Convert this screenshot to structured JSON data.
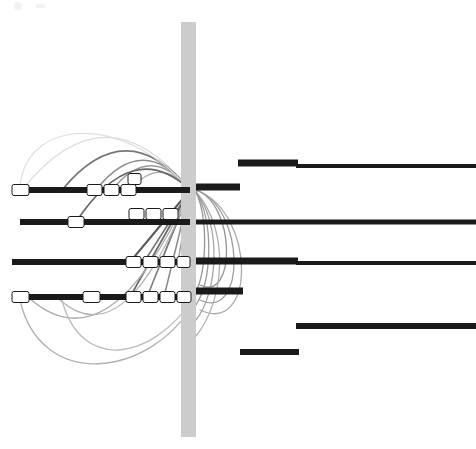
{
  "figure": {
    "title": "",
    "background_color": "#ffffff",
    "width": 476,
    "height": 449
  },
  "chart_data": {
    "type": "diagram",
    "subtype": "synteny-arc-linkage-plot",
    "title": "",
    "subtitle": "",
    "xlabel": "",
    "ylabel": "",
    "grid": false,
    "legend": null,
    "xlim": [
      0,
      476
    ],
    "ylim": [
      0,
      449
    ],
    "colors": {
      "track_dark": "#1a1a1a",
      "track_medium": "#2b2b2b",
      "feature_fill": "#ffffff",
      "feature_stroke": "#1a1a1a",
      "band_fill": "#cccccc",
      "arc_dark": "#555555",
      "arc_mid": "#8c8c8c",
      "arc_light": "#bdbdbd",
      "arc_faint": "#dcdcdc",
      "background": "#ffffff"
    },
    "hub": {
      "x": 190,
      "y": 190,
      "label": "convergence-hub"
    },
    "vertical_band": {
      "x": 181,
      "y": 22,
      "width": 15,
      "height": 415,
      "color": "#cccccc",
      "label": "highlight-band"
    },
    "left_tracks": [
      {
        "id": "left-track-1",
        "y": 190,
        "x_start": 12,
        "x_end": 190,
        "thickness": 6,
        "color": "#1a1a1a",
        "features": [
          {
            "x": 12,
            "width": 17,
            "height": 11
          },
          {
            "x": 87,
            "width": 15,
            "height": 11
          },
          {
            "x": 104,
            "width": 15,
            "height": 11
          },
          {
            "x": 121,
            "width": 15,
            "height": 11
          },
          {
            "x": 128,
            "width": 13,
            "height": 11,
            "offset_y": -11
          }
        ]
      },
      {
        "id": "left-track-2",
        "y": 222,
        "x_start": 20,
        "x_end": 190,
        "thickness": 6,
        "color": "#1a1a1a",
        "features": [
          {
            "x": 68,
            "width": 16,
            "height": 11
          },
          {
            "x": 129,
            "width": 15,
            "height": 11,
            "offset_y": -8
          },
          {
            "x": 146,
            "width": 15,
            "height": 11,
            "offset_y": -8
          },
          {
            "x": 163,
            "width": 15,
            "height": 11,
            "offset_y": -8
          }
        ]
      },
      {
        "id": "left-track-3",
        "y": 262,
        "x_start": 12,
        "x_end": 190,
        "thickness": 6,
        "color": "#1a1a1a",
        "features": [
          {
            "x": 126,
            "width": 15,
            "height": 11
          },
          {
            "x": 143,
            "width": 15,
            "height": 11
          },
          {
            "x": 160,
            "width": 15,
            "height": 11
          },
          {
            "x": 177,
            "width": 13,
            "height": 11
          }
        ]
      },
      {
        "id": "left-track-4",
        "y": 297,
        "x_start": 12,
        "x_end": 190,
        "thickness": 6,
        "color": "#1a1a1a",
        "features": [
          {
            "x": 12,
            "width": 17,
            "height": 11
          },
          {
            "x": 83,
            "width": 17,
            "height": 11
          },
          {
            "x": 126,
            "width": 15,
            "height": 11
          },
          {
            "x": 143,
            "width": 15,
            "height": 11
          },
          {
            "x": 160,
            "width": 15,
            "height": 11
          },
          {
            "x": 177,
            "width": 14,
            "height": 11
          }
        ]
      }
    ],
    "right_tracks": [
      {
        "id": "right-track-1a",
        "y": 163,
        "x_start": 238,
        "x_end": 298,
        "thickness": 7,
        "color": "#1a1a1a"
      },
      {
        "id": "right-track-1b",
        "y": 166,
        "x_start": 296,
        "x_end": 476,
        "thickness": 4,
        "color": "#1a1a1a"
      },
      {
        "id": "right-track-2",
        "y": 187,
        "x_start": 196,
        "x_end": 240,
        "thickness": 7,
        "color": "#1a1a1a"
      },
      {
        "id": "right-track-3",
        "y": 222,
        "x_start": 196,
        "x_end": 476,
        "thickness": 5,
        "color": "#1a1a1a"
      },
      {
        "id": "right-track-4a",
        "y": 261,
        "x_start": 196,
        "x_end": 298,
        "thickness": 7,
        "color": "#1a1a1a"
      },
      {
        "id": "right-track-4b",
        "y": 263,
        "x_start": 296,
        "x_end": 476,
        "thickness": 4,
        "color": "#1a1a1a"
      },
      {
        "id": "right-track-5",
        "y": 291,
        "x_start": 196,
        "x_end": 243,
        "thickness": 7,
        "color": "#1a1a1a"
      },
      {
        "id": "right-track-6",
        "y": 326,
        "x_start": 296,
        "x_end": 476,
        "thickness": 6,
        "color": "#1a1a1a"
      },
      {
        "id": "right-track-7",
        "y": 352,
        "x_start": 240,
        "x_end": 299,
        "thickness": 6,
        "color": "#1a1a1a"
      }
    ],
    "arcs": [
      {
        "id": "arc-1",
        "from_x": 22,
        "from_y": 190,
        "to_x": 190,
        "to_y": 190,
        "rise": 78,
        "color": "#dcdcdc",
        "width": 1.2,
        "direction": "up"
      },
      {
        "id": "arc-2",
        "from_x": 62,
        "from_y": 190,
        "to_x": 190,
        "to_y": 190,
        "rise": 58,
        "color": "#777777",
        "width": 1.8,
        "direction": "up"
      },
      {
        "id": "arc-3",
        "from_x": 96,
        "from_y": 190,
        "to_x": 190,
        "to_y": 190,
        "rise": 44,
        "color": "#8c8c8c",
        "width": 1.6,
        "direction": "up"
      },
      {
        "id": "arc-4",
        "from_x": 112,
        "from_y": 190,
        "to_x": 190,
        "to_y": 190,
        "rise": 36,
        "color": "#9a9a9a",
        "width": 1.4,
        "direction": "up"
      },
      {
        "id": "arc-5",
        "from_x": 130,
        "from_y": 190,
        "to_x": 190,
        "to_y": 190,
        "rise": 26,
        "color": "#a8a8a8",
        "width": 1.3,
        "direction": "up"
      },
      {
        "id": "arc-6",
        "from_x": 76,
        "from_y": 222,
        "to_x": 190,
        "to_y": 190,
        "rise": 40,
        "color": "#666666",
        "width": 1.8,
        "direction": "up"
      },
      {
        "id": "arc-7",
        "from_x": 130,
        "from_y": 262,
        "to_x": 190,
        "to_y": 190,
        "rise": 0,
        "color": "#5a5a5a",
        "width": 2.0,
        "direction": "straight"
      },
      {
        "id": "arc-8",
        "from_x": 144,
        "from_y": 262,
        "to_x": 190,
        "to_y": 190,
        "rise": 0,
        "color": "#777777",
        "width": 1.6,
        "direction": "straight"
      },
      {
        "id": "arc-9",
        "from_x": 161,
        "from_y": 262,
        "to_x": 190,
        "to_y": 190,
        "rise": 0,
        "color": "#888888",
        "width": 1.5,
        "direction": "straight"
      },
      {
        "id": "arc-10",
        "from_x": 178,
        "from_y": 262,
        "to_x": 190,
        "to_y": 190,
        "rise": 0,
        "color": "#999999",
        "width": 1.4,
        "direction": "straight"
      },
      {
        "id": "arc-11",
        "from_x": 130,
        "from_y": 297,
        "to_x": 190,
        "to_y": 190,
        "rise": 0,
        "color": "#6a6a6a",
        "width": 1.7,
        "direction": "straight"
      },
      {
        "id": "arc-12",
        "from_x": 147,
        "from_y": 297,
        "to_x": 190,
        "to_y": 190,
        "rise": 0,
        "color": "#7a7a7a",
        "width": 1.6,
        "direction": "straight"
      },
      {
        "id": "arc-13",
        "from_x": 164,
        "from_y": 297,
        "to_x": 190,
        "to_y": 190,
        "rise": 0,
        "color": "#8a8a8a",
        "width": 1.5,
        "direction": "straight"
      },
      {
        "id": "arc-14",
        "from_x": 181,
        "from_y": 297,
        "to_x": 190,
        "to_y": 190,
        "rise": 0,
        "color": "#9a9a9a",
        "width": 1.4,
        "direction": "straight"
      },
      {
        "id": "arc-15",
        "from_x": 190,
        "from_y": 190,
        "to_x": 28,
        "to_y": 297,
        "rise": 70,
        "color": "#aaaaaa",
        "width": 1.3,
        "direction": "down"
      },
      {
        "id": "arc-16",
        "from_x": 190,
        "from_y": 190,
        "to_x": 60,
        "to_y": 300,
        "rise": 55,
        "color": "#b5b5b5",
        "width": 1.3,
        "direction": "down"
      },
      {
        "id": "arc-17",
        "from_x": 196,
        "from_y": 190,
        "to_x": 200,
        "to_y": 310,
        "rise": 48,
        "color": "#aaaaaa",
        "width": 1.3,
        "direction": "down-right"
      },
      {
        "id": "arc-18",
        "from_x": 196,
        "from_y": 190,
        "to_x": 200,
        "to_y": 300,
        "rise": 40,
        "color": "#9e9e9e",
        "width": 1.3,
        "direction": "down-right"
      },
      {
        "id": "arc-19",
        "from_x": 196,
        "from_y": 190,
        "to_x": 200,
        "to_y": 285,
        "rise": 32,
        "color": "#949494",
        "width": 1.3,
        "direction": "down-right"
      }
    ],
    "watermark": {
      "present": true,
      "x": 14,
      "y": 4,
      "description": "faint partial mark top-left"
    }
  }
}
